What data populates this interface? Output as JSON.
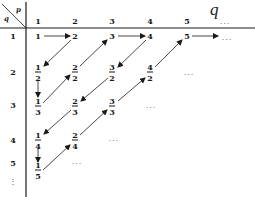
{
  "title_axis_label": "q",
  "corner": {
    "top": "p",
    "bottom": "q"
  },
  "column_headers": [
    "1",
    "2",
    "3",
    "4",
    "5",
    "..."
  ],
  "row_headers": [
    "1",
    "2",
    "3",
    "4",
    "5"
  ],
  "row_continuation": "⋮",
  "cells": [
    {
      "id": "c11",
      "type": "int",
      "value": "1"
    },
    {
      "id": "c12",
      "type": "int",
      "value": "2"
    },
    {
      "id": "c13",
      "type": "int",
      "value": "3"
    },
    {
      "id": "c14",
      "type": "int",
      "value": "4"
    },
    {
      "id": "c15",
      "type": "int",
      "value": "5"
    },
    {
      "id": "c21",
      "type": "frac",
      "num": "1",
      "den": "2"
    },
    {
      "id": "c22",
      "type": "frac",
      "num": "2",
      "den": "2"
    },
    {
      "id": "c23",
      "type": "frac",
      "num": "3",
      "den": "2"
    },
    {
      "id": "c24",
      "type": "frac",
      "num": "4",
      "den": "2"
    },
    {
      "id": "c31",
      "type": "frac",
      "num": "1",
      "den": "3"
    },
    {
      "id": "c32",
      "type": "frac",
      "num": "2",
      "den": "3"
    },
    {
      "id": "c33",
      "type": "frac",
      "num": "3",
      "den": "3"
    },
    {
      "id": "c41",
      "type": "frac",
      "num": "1",
      "den": "4"
    },
    {
      "id": "c42",
      "type": "frac",
      "num": "2",
      "den": "4"
    },
    {
      "id": "c51",
      "type": "frac",
      "num": "1",
      "den": "5"
    }
  ],
  "ellipses": {
    "row1": "...",
    "row2": "...",
    "row3": "...",
    "row4": "...",
    "row5": "..."
  },
  "path_order": [
    "1",
    "2",
    "1/2",
    "1/3",
    "2/2",
    "3",
    "4",
    "3/2",
    "2/3",
    "1/4",
    "1/5",
    "2/4",
    "3/3",
    "4/2",
    "5",
    "..."
  ]
}
